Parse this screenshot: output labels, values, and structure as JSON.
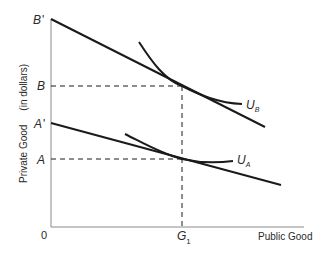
{
  "diagram": {
    "type": "public-goods-indifference",
    "axes": {
      "y_label": "Private Good",
      "y_unit": "(in dollars)",
      "x_label": "Public Good",
      "origin": "0"
    },
    "y_ticks": [
      {
        "label": "B'",
        "base": "B",
        "prime": "'"
      },
      {
        "label": "B",
        "base": "B",
        "prime": ""
      },
      {
        "label": "A'",
        "base": "A",
        "prime": "'"
      },
      {
        "label": "A",
        "base": "A",
        "prime": ""
      }
    ],
    "x_ticks": [
      {
        "label": "G1",
        "base": "G",
        "sub": "1"
      }
    ],
    "curves": [
      {
        "name": "U_B",
        "base": "U",
        "sub": "B",
        "kind": "indifference-curve"
      },
      {
        "name": "U_A",
        "base": "U",
        "sub": "A",
        "kind": "indifference-curve"
      }
    ],
    "lines": [
      {
        "name": "budget-line-B-prime",
        "from": "B'",
        "kind": "budget-line"
      },
      {
        "name": "budget-line-A-prime",
        "from": "A'",
        "kind": "budget-line"
      }
    ],
    "colors": {
      "ink": "#1a1a1a",
      "label": "#2a2a2a",
      "background": "#ffffff"
    }
  }
}
